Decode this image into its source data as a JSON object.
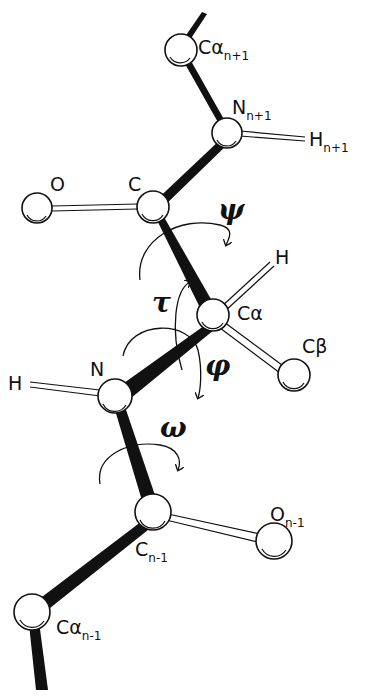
{
  "diagram": {
    "type": "peptide-backbone-torsion-angles",
    "atoms": [
      {
        "id": "ca_np1",
        "label": "Cα",
        "sub": "n+1"
      },
      {
        "id": "n_np1",
        "label": "N",
        "sub": "n+1"
      },
      {
        "id": "h_np1",
        "label": "H",
        "sub": "n+1"
      },
      {
        "id": "o",
        "label": "O",
        "sub": ""
      },
      {
        "id": "c",
        "label": "C",
        "sub": ""
      },
      {
        "id": "h_ca",
        "label": "H",
        "sub": ""
      },
      {
        "id": "ca",
        "label": "Cα",
        "sub": ""
      },
      {
        "id": "cb",
        "label": "Cβ",
        "sub": ""
      },
      {
        "id": "h_n",
        "label": "H",
        "sub": ""
      },
      {
        "id": "n",
        "label": "N",
        "sub": ""
      },
      {
        "id": "o_nm1",
        "label": "O",
        "sub": "n-1"
      },
      {
        "id": "c_nm1",
        "label": "C",
        "sub": "n-1"
      },
      {
        "id": "ca_nm1",
        "label": "Cα",
        "sub": "n-1"
      }
    ],
    "angles": [
      {
        "id": "psi",
        "symbol": "ψ"
      },
      {
        "id": "tau",
        "symbol": "τ"
      },
      {
        "id": "phi",
        "symbol": "φ"
      },
      {
        "id": "omega",
        "symbol": "ω"
      }
    ]
  }
}
